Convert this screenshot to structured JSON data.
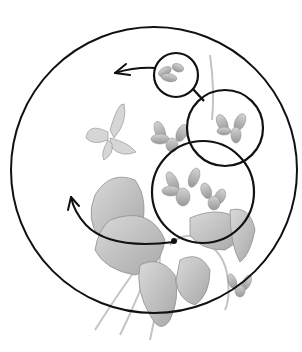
{
  "diagram": {
    "background": "#ffffff",
    "stroke_color": "#111111",
    "illustration_gray": "#9a9a9a",
    "illustration_light": "#c8c8c8",
    "outer_circle": {
      "cx": 154,
      "cy": 170,
      "r": 143
    },
    "zoom_circles": [
      {
        "cx": 176,
        "cy": 75,
        "r": 22
      },
      {
        "cx": 225,
        "cy": 128,
        "r": 38
      },
      {
        "cx": 203,
        "cy": 192,
        "r": 51
      }
    ],
    "arrows": [
      {
        "kind": "straight",
        "from": [
          155,
          68
        ],
        "to": [
          114,
          73
        ]
      },
      {
        "kind": "arc",
        "from": [
          175,
          242
        ],
        "to": [
          71,
          196
        ]
      }
    ],
    "subjects": [
      "violet bouquet",
      "butterfly"
    ]
  }
}
